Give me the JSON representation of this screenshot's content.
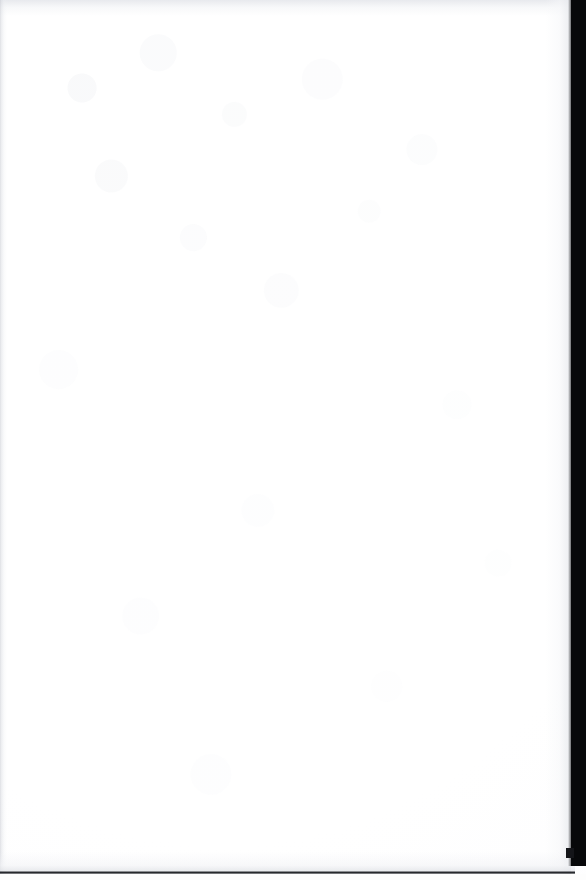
{
  "document": {
    "page_kind": "blank-scanned-page",
    "body_text": "",
    "caption": "Blank page"
  },
  "scan": {
    "width_px": 586,
    "height_px": 880,
    "page_background_color": "#ffffff",
    "paper_tint_color": "#fbfbfc",
    "texture_color": "#eef0f3"
  },
  "edges": {
    "top_shade": {
      "name": "top-edge-shade",
      "color": "#e2e4e9",
      "height_px": 16
    },
    "left_gutter": {
      "name": "left-gutter-line",
      "color": "#c4c7ce",
      "width_px": 7
    },
    "right_band": {
      "name": "right-scan-band",
      "color": "#07080a",
      "start_x_px": 571,
      "width_px": 15,
      "height_px": 866
    },
    "right_band_notch": {
      "name": "right-band-notch",
      "color": "#141519",
      "x_px": 566,
      "y_px": 848
    },
    "bottom_line": {
      "name": "bottom-edge-line",
      "color": "#2b2d32",
      "y_px": 871,
      "width_px": 575,
      "thickness_px": 3
    }
  }
}
